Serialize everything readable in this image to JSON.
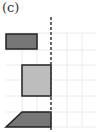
{
  "panel": {
    "label": "(c)"
  },
  "colors": {
    "dark_fill": "#777777",
    "light_fill": "#bdbdbd",
    "stroke": "#222222",
    "grid": "#e6e6e6",
    "dashed": "#444444"
  },
  "shapes": [
    {
      "type": "rectangle",
      "fill": "dark"
    },
    {
      "type": "rectangle",
      "fill": "light"
    },
    {
      "type": "trapezoid",
      "fill": "dark"
    }
  ]
}
